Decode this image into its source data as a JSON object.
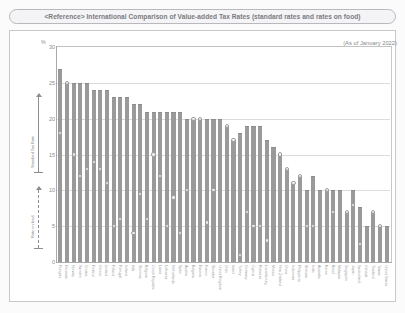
{
  "title": "<Reference> International Comparison of Value-added Tax Rates (standard rates and rates on food)",
  "asof_note": "(As of January 2022)",
  "axis": {
    "y_unit": "%",
    "y_ticks": [
      "30",
      "25",
      "20",
      "15",
      "10",
      "5",
      "0"
    ]
  },
  "annotations": {
    "standard_rate_label": "Standard Tax Rate",
    "food_rate_label": "Rate on food"
  },
  "colors": {
    "bar": "#9a9a9a",
    "marker_outline": "#9c9c9c",
    "grid": "#dcdcdc",
    "frame": "#c9c9cd",
    "title_text": "#7a7a80"
  },
  "chart_data": {
    "type": "bar",
    "title": "<Reference> International Comparison of Value-added Tax Rates (standard rates and rates on food)",
    "xlabel": "",
    "ylabel": "%",
    "ylim": [
      0,
      30
    ],
    "grid": true,
    "legend_position": "left-annotations",
    "series": [
      {
        "name": "Standard Tax Rate",
        "type": "bar"
      },
      {
        "name": "Rate on food",
        "type": "marker"
      }
    ],
    "categories": [
      "Hungary",
      "Denmark",
      "Norway",
      "Sweden",
      "Croatia",
      "Finland",
      "Greece",
      "Iceland",
      "Poland",
      "Portugal",
      "Ireland",
      "Italy",
      "Slovenia",
      "Belgium",
      "Czech Republic",
      "Latvia",
      "Lithuania",
      "Netherlands",
      "Spain",
      "Austria",
      "Bulgaria",
      "Estonia",
      "France",
      "Slovakia",
      "United Kingdom",
      "Chile",
      "Israel",
      "Turkey",
      "Germany",
      "Cyprus",
      "Romania",
      "Luxembourg",
      "Mexico",
      "New Zealand",
      "China",
      "Indonesia",
      "Philippines",
      "Vietnam",
      "India",
      "Australia",
      "Korea",
      "Brazil",
      "Malaysia",
      "Singapore",
      "Japan",
      "Switzerland",
      "Canada",
      "Thailand",
      "Taiwan",
      "United States"
    ],
    "values": [
      27,
      25,
      25,
      25,
      25,
      24,
      24,
      24,
      23,
      23,
      23,
      22,
      22,
      21,
      21,
      21,
      21,
      21,
      21,
      20,
      20,
      20,
      20,
      20,
      20,
      19,
      17,
      18,
      19,
      19,
      19,
      17,
      16,
      15,
      13,
      11,
      12,
      10,
      12,
      10,
      10,
      10,
      10,
      7,
      10,
      7.7,
      5,
      7,
      5,
      5
    ],
    "food_values": [
      18,
      25,
      15,
      12,
      13,
      14,
      13,
      11,
      5,
      6,
      0,
      4,
      9.5,
      6,
      15,
      12,
      5,
      9,
      4,
      10,
      20,
      20,
      5.5,
      10,
      0,
      19,
      17,
      1,
      7,
      5,
      5,
      3,
      0,
      15,
      13,
      11,
      12,
      5,
      5,
      0,
      10,
      7,
      0,
      7,
      8,
      2.5,
      0,
      7,
      5,
      0
    ]
  }
}
